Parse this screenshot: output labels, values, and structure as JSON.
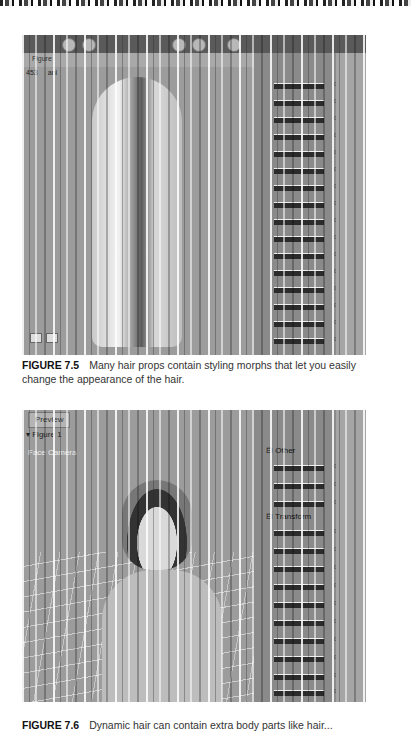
{
  "page": {
    "figures": [
      {
        "id": "7.5",
        "label": "FIGURE 7.5",
        "caption": "Many hair props contain styling morphs that let you easily change the appearance of the hair.",
        "screenshot": {
          "toolbar": {
            "field_label": "Figure",
            "field_value": "453",
            "mode_value": "ani"
          },
          "panel_values": [
            "0.000",
            "0.000",
            "0.000",
            "0.000",
            "0.000",
            "0.000",
            "0.000",
            "0.000",
            "0.000",
            "0.000",
            "0.000",
            "0.000",
            "0.000",
            "0.000",
            "0.000",
            "0.000"
          ]
        }
      },
      {
        "id": "7.6",
        "label": "FIGURE 7.6",
        "caption": "Dynamic hair can contain extra body parts like hair...",
        "screenshot": {
          "tab_label": "Preview",
          "figure_select": "Figure 1",
          "camera_label": "Face Camera",
          "groups": [
            {
              "icon": "⊟",
              "label": "Other"
            },
            {
              "icon": "⊟",
              "label": "Transform"
            }
          ],
          "panel_values": [
            "0.000",
            "0.000",
            "0.000",
            "0.000",
            "0.000",
            "0.000",
            "0.000",
            "0.000",
            "0.000",
            "0.000",
            "0.000",
            "0.000",
            "0.000"
          ]
        }
      }
    ]
  }
}
